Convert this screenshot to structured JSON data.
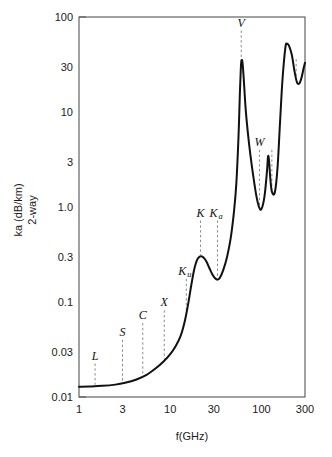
{
  "figure": {
    "title": "",
    "background_color": "#ffffff",
    "curve_color": "#111111",
    "frame_color": "#555555",
    "leader_color": "#8a8a8a"
  },
  "chart_data": {
    "type": "line",
    "title": "",
    "subtitle": "",
    "xlabel": "f(GHz)",
    "ylabel_line1": "ka (dB/km)",
    "ylabel_line2": "2-way",
    "xscale": "log",
    "yscale": "log",
    "xlim": [
      1,
      300
    ],
    "ylim": [
      0.01,
      100
    ],
    "grid": false,
    "legend_position": "none",
    "xticks": [
      1,
      3,
      10,
      30,
      100,
      300
    ],
    "xtick_labels": [
      "1",
      "3",
      "10",
      "30",
      "100",
      "300"
    ],
    "yticks": [
      0.01,
      0.03,
      0.1,
      0.3,
      1.0,
      3,
      10,
      30,
      100
    ],
    "ytick_labels": [
      "0.01",
      "0.03",
      "0.1",
      "0.3",
      "1.0",
      "3",
      "10",
      "30",
      "100"
    ],
    "series": [
      {
        "name": "Atmospheric attenuation (2-way)",
        "x": [
          1.0,
          1.3,
          1.8,
          2.5,
          3.2,
          4.2,
          5.5,
          7.0,
          8.5,
          10.0,
          11.5,
          13.0,
          14.5,
          15.8,
          17.0,
          18.2,
          19.2,
          20.0,
          21.0,
          22.3,
          23.5,
          25.0,
          27.0,
          29.0,
          31.0,
          33.0,
          35.0,
          38.0,
          42.0,
          46.0,
          50.0,
          53.0,
          56.0,
          58.0,
          59.5,
          60.5,
          62.0,
          64.0,
          67.0,
          71.0,
          76.0,
          82.0,
          88.0,
          94.0,
          100.0,
          108.0,
          115.0,
          118.0,
          121.0,
          125.0,
          130.0,
          140.0,
          150.0,
          160.0,
          170.0,
          183.0,
          190.0,
          200.0,
          215.0,
          230.0,
          245.0,
          260.0,
          275.0,
          290.0,
          300.0
        ],
        "y": [
          0.0128,
          0.0129,
          0.0131,
          0.0135,
          0.0141,
          0.0152,
          0.0171,
          0.0202,
          0.0238,
          0.0283,
          0.0345,
          0.044,
          0.064,
          0.098,
          0.15,
          0.215,
          0.26,
          0.285,
          0.3,
          0.301,
          0.29,
          0.265,
          0.225,
          0.195,
          0.178,
          0.172,
          0.18,
          0.215,
          0.3,
          0.47,
          0.9,
          1.75,
          5.5,
          16.0,
          30.0,
          35.0,
          33.0,
          22.0,
          11.0,
          6.0,
          3.4,
          2.0,
          1.3,
          1.0,
          0.95,
          1.3,
          2.4,
          3.4,
          3.1,
          2.0,
          1.45,
          1.42,
          2.6,
          8.0,
          22.0,
          48.0,
          52.0,
          50.0,
          40.0,
          27.0,
          20.5,
          20.0,
          23.0,
          29.0,
          33.0
        ]
      }
    ],
    "annotations": [
      {
        "label": "L",
        "sub": "",
        "freq_ghz": 1.5,
        "value": 0.0225
      },
      {
        "label": "S",
        "sub": "",
        "freq_ghz": 3.0,
        "value": 0.04
      },
      {
        "label": "C",
        "sub": "",
        "freq_ghz": 5.0,
        "value": 0.06
      },
      {
        "label": "X",
        "sub": "",
        "freq_ghz": 8.6,
        "value": 0.082
      },
      {
        "label": "K",
        "sub": "u",
        "freq_ghz": 15.0,
        "value": 0.175
      },
      {
        "label": "K",
        "sub": "",
        "freq_ghz": 21.5,
        "value": 0.72
      },
      {
        "label": "K",
        "sub": "a",
        "freq_ghz": 33.0,
        "value": 0.72
      },
      {
        "label": "V",
        "sub": "",
        "freq_ghz": 60.0,
        "value": 72.0
      },
      {
        "label": "W",
        "sub": "",
        "freq_ghz": 95.0,
        "value": 4.0
      },
      {
        "label": "",
        "sub": "",
        "freq_ghz": 130.0,
        "value": 4.0
      },
      {
        "label": "",
        "sub": "",
        "freq_ghz": 240.0,
        "value": 36.0
      }
    ]
  }
}
